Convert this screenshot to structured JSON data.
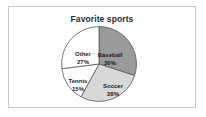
{
  "card": {
    "border_color": "#c9c9c9",
    "background": "#ffffff"
  },
  "chart_data": {
    "type": "pie",
    "title": "Favorite sports",
    "xlabel": "",
    "ylabel": "",
    "legend_position": "none",
    "grid": false,
    "start_angle_deg": 0,
    "direction": "clockwise",
    "categories": [
      "Baseball",
      "Soccer",
      "Tennis",
      "Other"
    ],
    "values": [
      30,
      28,
      15,
      27
    ],
    "value_unit": "%",
    "labels": [
      "Baseball 30%",
      "Soccer 28%",
      "Tennis 15%",
      "Other 27%"
    ],
    "slices": [
      {
        "name": "Baseball",
        "value": 30,
        "value_label": "30%",
        "color": "#9a9a9a",
        "stroke": "#555555"
      },
      {
        "name": "Soccer",
        "value": 28,
        "value_label": "28%",
        "color": "#d8d8d8",
        "stroke": "#555555"
      },
      {
        "name": "Tennis",
        "value": 15,
        "value_label": "15%",
        "color": "#ffffff",
        "stroke": "#555555"
      },
      {
        "name": "Other",
        "value": 27,
        "value_label": "27%",
        "color": "#ffffff",
        "stroke": "#555555"
      }
    ]
  }
}
